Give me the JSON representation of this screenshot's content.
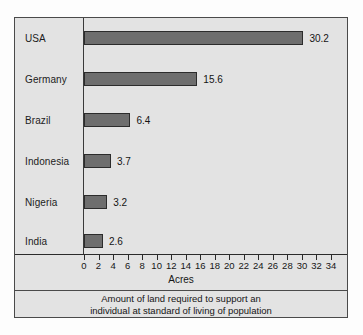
{
  "chart_data": {
    "type": "bar",
    "orientation": "horizontal",
    "title": "",
    "categories": [
      "USA",
      "Germany",
      "Brazil",
      "Indonesia",
      "Nigeria",
      "India"
    ],
    "values": [
      30.2,
      15.6,
      6.4,
      3.7,
      3.2,
      2.6
    ],
    "value_labels": [
      "30.2",
      "15.6",
      "6.4",
      "3.7",
      "3.2",
      "2.6"
    ],
    "xlabel": "Acres",
    "ylabel": "",
    "xlim": [
      0,
      34
    ],
    "xticks": [
      0,
      2,
      4,
      6,
      8,
      10,
      12,
      14,
      16,
      18,
      20,
      22,
      24,
      26,
      28,
      30,
      32,
      34
    ],
    "xtick_labels": [
      "0",
      "2",
      "4",
      "6",
      "8",
      "10",
      "12",
      "14",
      "16",
      "18",
      "20",
      "22",
      "24",
      "26",
      "28",
      "30",
      "32",
      "34"
    ],
    "grid": false,
    "legend": null,
    "caption": {
      "line1": "Amount of land required to support an",
      "line2": "individual at standard of living of population"
    },
    "colors": {
      "bar_fill": "#6e6e6e",
      "bar_stroke": "#2c2c2c",
      "panel_background": "#e3e3e3",
      "frame_border": "#4a4a4a",
      "axis_line": "#2b2b2b",
      "text": "#161616"
    }
  }
}
